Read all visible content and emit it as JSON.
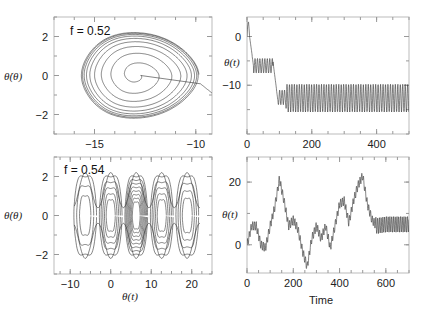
{
  "chart_data": [
    {
      "id": "top-left",
      "type": "line",
      "title": "",
      "annotation": "f = 0.52",
      "xlabel": "",
      "ylabel": "θ̇(θ)",
      "xlim": [
        -17,
        -9.2
      ],
      "ylim": [
        -3,
        3
      ],
      "xticks": [
        -15,
        -10
      ],
      "xtick_labels": [
        "−15",
        "−10"
      ],
      "yticks": [
        -2,
        0,
        2
      ],
      "ytick_labels": [
        "−2",
        "0",
        "2"
      ],
      "description": "Phase portrait spiraling outward from center (~-13, 0) to a limit cycle spanning θ ≈ -15.5 to -9.7, θ̇ ≈ ±2.2; trajectory enters from right at θ ≈ -9.2",
      "series": [
        {
          "name": "trajectory",
          "center": [
            -12.6,
            0
          ],
          "limit_cycle_x": [
            -15.5,
            -9.7
          ],
          "limit_cycle_y": [
            -2.2,
            2.2
          ]
        }
      ]
    },
    {
      "id": "top-right",
      "type": "line",
      "title": "",
      "xlabel": "",
      "ylabel": "θ(t)",
      "xlim": [
        0,
        500
      ],
      "ylim": [
        -20,
        4
      ],
      "xticks": [
        0,
        200,
        400
      ],
      "xtick_labels": [
        "0",
        "200",
        "400"
      ],
      "yticks": [
        0,
        -10
      ],
      "ytick_labels": [
        "0",
        "−10"
      ],
      "series": [
        {
          "name": "theta",
          "segments": [
            {
              "t": [
                0,
                15
              ],
              "desc": "spike up to ~3 then transient"
            },
            {
              "t": [
                20,
                80
              ],
              "oscillation_range": [
                -7.5,
                -4.5
              ]
            },
            {
              "t": [
                80,
                120
              ],
              "desc": "drop from ~-5 to ~-13"
            },
            {
              "t": [
                120,
                500
              ],
              "oscillation_range": [
                -15.5,
                -9.8
              ]
            }
          ]
        }
      ]
    },
    {
      "id": "bottom-left",
      "type": "line",
      "title": "",
      "annotation": "f = 0.54",
      "xlabel": "θ(t)",
      "ylabel": "θ̇(θ)",
      "xlim": [
        -14,
        25
      ],
      "ylim": [
        -3,
        3
      ],
      "xticks": [
        -10,
        0,
        10,
        20
      ],
      "xtick_labels": [
        "−10",
        "0",
        "10",
        "20"
      ],
      "yticks": [
        -2,
        0,
        2
      ],
      "ytick_labels": [
        "−2",
        "0",
        "2"
      ],
      "description": "Chaotic phase portrait with nested loops centered at θ ≈ -6.3, 0, 6.3, 12.6, 18.9 (multiples of 2π), amplitude up to ±2.2",
      "series": [
        {
          "name": "trajectory",
          "loop_centers": [
            -6.3,
            0,
            6.3,
            12.6,
            18.9
          ]
        }
      ]
    },
    {
      "id": "bottom-right",
      "type": "line",
      "title": "",
      "xlabel": "Time",
      "ylabel": "θ(t)",
      "xlim": [
        0,
        700
      ],
      "ylim": [
        -9,
        28
      ],
      "xticks": [
        0,
        200,
        400,
        600
      ],
      "xtick_labels": [
        "0",
        "200",
        "400",
        "600"
      ],
      "yticks": [
        0,
        20
      ],
      "ytick_labels": [
        "0",
        "20"
      ],
      "series": [
        {
          "name": "theta",
          "x": [
            0,
            20,
            40,
            60,
            80,
            100,
            120,
            140,
            160,
            180,
            200,
            220,
            240,
            260,
            280,
            300,
            320,
            340,
            360,
            380,
            400,
            420,
            440,
            460,
            480,
            500,
            520,
            540,
            560,
            600,
            650,
            700
          ],
          "y": [
            0,
            6,
            6,
            0,
            -1,
            6,
            12,
            21,
            14,
            6,
            8,
            5,
            -2,
            -7,
            2,
            6,
            2,
            6,
            -1,
            6,
            13,
            14,
            7,
            14,
            19,
            22,
            13,
            8,
            6,
            6.5,
            6.5,
            6.5
          ],
          "final_oscillation_range": [
            4,
            9
          ]
        }
      ]
    }
  ],
  "panels": {
    "tl": {
      "annotation": "f = 0.52",
      "ylabel": "θ̇(θ)"
    },
    "tr": {
      "ylabel": "θ(t)"
    },
    "bl": {
      "annotation": "f = 0.54",
      "ylabel": "θ̇(θ)",
      "xlabel": "θ(t)"
    },
    "br": {
      "ylabel": "θ(t)",
      "xlabel": "Time"
    }
  }
}
